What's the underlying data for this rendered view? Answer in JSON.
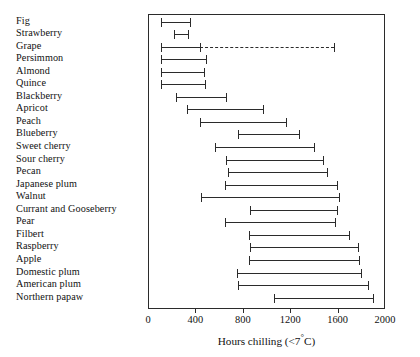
{
  "chart_data": {
    "type": "bar",
    "subtype": "range-interval",
    "title": "",
    "xlabel": "Hours chilling (<7°C)",
    "ylabel": "",
    "xlim": [
      0,
      2000
    ],
    "xticks": [
      0,
      400,
      800,
      1200,
      1600,
      2000
    ],
    "xticklabels": [
      "0",
      "400",
      "800",
      "1200",
      "1600",
      "2000"
    ],
    "grid": false,
    "legend": false,
    "categories": [
      "Fig",
      "Strawberry",
      "Grape",
      "Persimmon",
      "Almond",
      "Quince",
      "Blackberry",
      "Apricot",
      "Peach",
      "Blueberry",
      "Sweet cherry",
      "Sour cherry",
      "Pecan",
      "Japanese plum",
      "Walnut",
      "Currant and Gooseberry",
      "Pear",
      "Filbert",
      "Raspberry",
      "Apple",
      "Domestic plum",
      "American plum",
      "Northern papaw"
    ],
    "ranges": [
      {
        "category": "Fig",
        "low": 100,
        "high": 350,
        "dashed_to": null
      },
      {
        "category": "Strawberry",
        "low": 210,
        "high": 330,
        "dashed_to": null
      },
      {
        "category": "Grape",
        "low": 100,
        "high": 430,
        "dashed_to": 1560
      },
      {
        "category": "Persimmon",
        "low": 100,
        "high": 480,
        "dashed_to": null
      },
      {
        "category": "Almond",
        "low": 100,
        "high": 465,
        "dashed_to": null
      },
      {
        "category": "Quince",
        "low": 100,
        "high": 470,
        "dashed_to": null
      },
      {
        "category": "Blackberry",
        "low": 230,
        "high": 650,
        "dashed_to": null
      },
      {
        "category": "Apricot",
        "low": 320,
        "high": 960,
        "dashed_to": null
      },
      {
        "category": "Peach",
        "low": 430,
        "high": 1155,
        "dashed_to": null
      },
      {
        "category": "Blueberry",
        "low": 750,
        "high": 1265,
        "dashed_to": null
      },
      {
        "category": "Sweet cherry",
        "low": 555,
        "high": 1390,
        "dashed_to": null
      },
      {
        "category": "Sour cherry",
        "low": 650,
        "high": 1470,
        "dashed_to": null
      },
      {
        "category": "Pecan",
        "low": 665,
        "high": 1505,
        "dashed_to": null
      },
      {
        "category": "Japanese plum",
        "low": 645,
        "high": 1590,
        "dashed_to": null
      },
      {
        "category": "Walnut",
        "low": 440,
        "high": 1600,
        "dashed_to": null
      },
      {
        "category": "Currant and Gooseberry",
        "low": 850,
        "high": 1590,
        "dashed_to": null
      },
      {
        "category": "Pear",
        "low": 640,
        "high": 1570,
        "dashed_to": null
      },
      {
        "category": "Filbert",
        "low": 845,
        "high": 1690,
        "dashed_to": null
      },
      {
        "category": "Raspberry",
        "low": 850,
        "high": 1760,
        "dashed_to": null
      },
      {
        "category": "Apple",
        "low": 845,
        "high": 1770,
        "dashed_to": null
      },
      {
        "category": "Domestic plum",
        "low": 745,
        "high": 1790,
        "dashed_to": null
      },
      {
        "category": "American plum",
        "low": 750,
        "high": 1845,
        "dashed_to": null
      },
      {
        "category": "Northern papaw",
        "low": 1055,
        "high": 1890,
        "dashed_to": null
      }
    ]
  },
  "axis": {
    "title_main": "Hours chilling (<7",
    "title_sup": "°",
    "title_end": "C)"
  },
  "colors": {
    "line": "#2b2b2b",
    "text": "#111111",
    "background": "#ffffff"
  }
}
